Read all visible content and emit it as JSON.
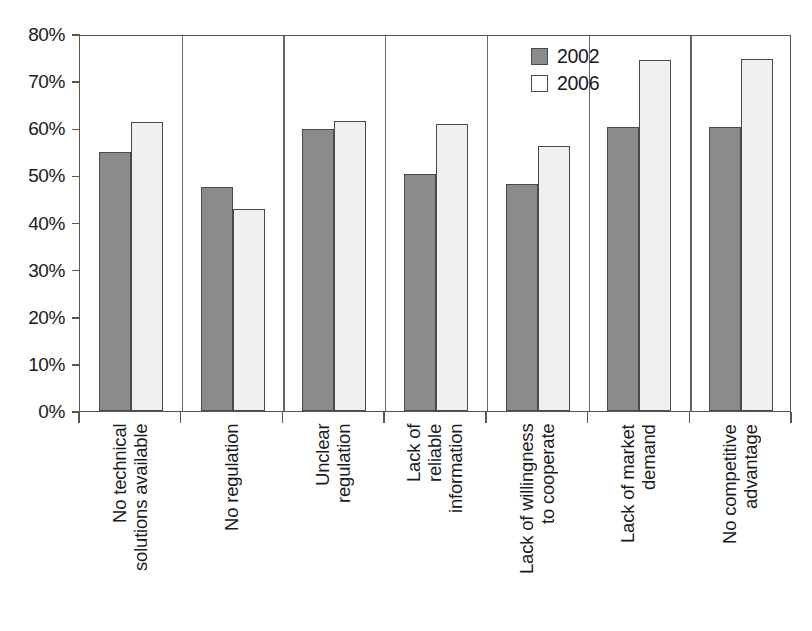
{
  "chart_data": {
    "type": "bar",
    "title": "",
    "subtitle": "",
    "xlabel": "",
    "ylabel": "",
    "ylim": [
      0,
      80
    ],
    "ytick_values": [
      80,
      70,
      60,
      50,
      40,
      30,
      20,
      10,
      0
    ],
    "ytick_labels": [
      "80%",
      "70%",
      "60%",
      "50%",
      "40%",
      "30%",
      "20%",
      "10%",
      "0%"
    ],
    "grid": false,
    "legend_position": "top-right",
    "categories": [
      "No technical solutions available",
      "No regulation",
      "Unclear regulation",
      "Lack of reliable information",
      "Lack of willingness to cooperate",
      "Lack of market demand",
      "No competitive advantage"
    ],
    "category_lines": [
      [
        "No technical",
        "solutions available"
      ],
      [
        "No regulation"
      ],
      [
        "Unclear",
        "regulation"
      ],
      [
        "Lack of",
        "reliable",
        "information"
      ],
      [
        "Lack of willingness",
        "to cooperate"
      ],
      [
        "Lack of market",
        "demand"
      ],
      [
        "No competitive",
        "advantage"
      ]
    ],
    "series": [
      {
        "name": "2002",
        "color": "#8b8b8b",
        "values": [
          55.0,
          47.6,
          59.8,
          50.3,
          48.2,
          60.3,
          60.3
        ]
      },
      {
        "name": "2006",
        "color": "#f0f0ee",
        "values": [
          61.3,
          42.8,
          61.5,
          61.0,
          56.2,
          74.5,
          74.6
        ]
      }
    ]
  },
  "legend": {
    "items": [
      {
        "label": "2002",
        "swatch": "series-a"
      },
      {
        "label": "2006",
        "swatch": "series-b"
      }
    ]
  }
}
